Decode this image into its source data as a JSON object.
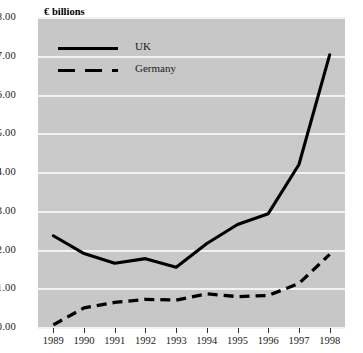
{
  "chart_data": {
    "type": "line",
    "title": "€ billions",
    "xlabel": "",
    "ylabel": "€ billions",
    "x": [
      "1989",
      "1990",
      "1991",
      "1992",
      "1993",
      "1994",
      "1995",
      "1996",
      "1997",
      "1998"
    ],
    "categories": [
      "1989",
      "1990",
      "1991",
      "1992",
      "1993",
      "1994",
      "1995",
      "1996",
      "1997",
      "1998"
    ],
    "series": [
      {
        "name": "UK",
        "style": "solid",
        "color": "#000000",
        "values": [
          2.38,
          1.92,
          1.67,
          1.79,
          1.57,
          2.18,
          2.67,
          2.95,
          4.22,
          7.05
        ]
      },
      {
        "name": "Germany",
        "style": "dashed",
        "color": "#000000",
        "values": [
          0.08,
          0.52,
          0.66,
          0.74,
          0.72,
          0.88,
          0.81,
          0.84,
          1.15,
          1.9
        ]
      }
    ],
    "ylim": [
      0,
      8
    ],
    "ytick_values": [
      0,
      1,
      2,
      3,
      4,
      5,
      6,
      7,
      8
    ],
    "ytick_labels": [
      "0.00",
      "1.00",
      "2.00",
      "3.00",
      "4.00",
      "5.00",
      "6.00",
      "7.00",
      "8.00"
    ],
    "grid": true,
    "grid_axis": "y",
    "grid_color": "#f2f2f2",
    "plot_background": "#c9c9c9",
    "legend_position": "upper-left",
    "legend_entries": [
      "UK",
      "Germany"
    ]
  },
  "legend": {
    "uk_label": "UK",
    "germany_label": "Germany"
  },
  "axis": {
    "title": "€ billions"
  }
}
